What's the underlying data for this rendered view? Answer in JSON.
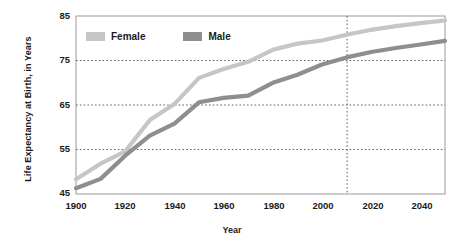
{
  "chart_data": {
    "type": "line",
    "title": "",
    "xlabel": "Year",
    "ylabel": "Life Expectancy at Birth, in Years",
    "xlim": [
      1900,
      2050
    ],
    "ylim": [
      45,
      85
    ],
    "xticks": [
      "1900",
      "1920",
      "1940",
      "1960",
      "1980",
      "2000",
      "2020",
      "2040"
    ],
    "xtick_values": [
      1900,
      1920,
      1940,
      1960,
      1980,
      2000,
      2020,
      2040
    ],
    "yticks": [
      "45",
      "55",
      "65",
      "75",
      "85"
    ],
    "ytick_values": [
      45,
      55,
      65,
      75,
      85
    ],
    "grid": "horizontal dotted at 55, 65, 75; vertical dotted at 2010",
    "projection_line_x": 2010,
    "legend_position": "top-left inside plot",
    "series": [
      {
        "name": "Female",
        "color": "#c6c6c6",
        "x": [
          1900,
          1910,
          1920,
          1930,
          1940,
          1950,
          1960,
          1970,
          1980,
          1990,
          2000,
          2010,
          2020,
          2030,
          2040,
          2050
        ],
        "values": [
          48.3,
          51.8,
          54.6,
          61.6,
          65.2,
          71.1,
          73.1,
          74.7,
          77.4,
          78.8,
          79.5,
          80.8,
          81.9,
          82.7,
          83.4,
          84.0
        ]
      },
      {
        "name": "Male",
        "color": "#8e8e8e",
        "x": [
          1900,
          1910,
          1920,
          1930,
          1940,
          1950,
          1960,
          1970,
          1980,
          1990,
          2000,
          2010,
          2020,
          2030,
          2040,
          2050
        ],
        "values": [
          46.3,
          48.4,
          53.6,
          58.1,
          60.8,
          65.6,
          66.6,
          67.1,
          70.0,
          71.8,
          74.1,
          75.7,
          76.9,
          77.8,
          78.6,
          79.4
        ]
      }
    ]
  },
  "legend": {
    "female_label": "Female",
    "male_label": "Male"
  },
  "axes": {
    "x_title": "Year",
    "y_title": "Life Expectancy at Birth, in Years"
  }
}
